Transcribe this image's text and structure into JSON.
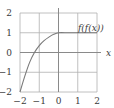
{
  "chart_data": {
    "type": "line",
    "title": "",
    "xlabel": "x",
    "ylabel": "",
    "xlim": [
      -2,
      2
    ],
    "ylim": [
      -2,
      2
    ],
    "grid": true,
    "x_ticks": [
      "−2",
      "−1",
      "0",
      "1",
      "2"
    ],
    "y_ticks": [
      "2",
      "1",
      "0",
      "−1",
      "−2"
    ],
    "series": [
      {
        "name": "f(f(x))",
        "x": [
          -2,
          -1.75,
          -1.5,
          -1.25,
          -1,
          -0.75,
          -0.5,
          -0.25,
          0,
          0.5,
          1,
          1.5,
          2
        ],
        "values": [
          -2,
          -1.2,
          -0.5,
          0.0,
          0.35,
          0.6,
          0.78,
          0.92,
          1.0,
          1.0,
          1.0,
          1.0,
          1.0
        ]
      }
    ],
    "annotations": [
      {
        "text": "f(f(x))",
        "x": 1.3,
        "y": 1.3
      }
    ],
    "colors": {
      "curve": "#7a7a7a",
      "grid": "#b0b0b0",
      "axis": "#8a8a8a",
      "text": "#3a3a3a"
    }
  }
}
